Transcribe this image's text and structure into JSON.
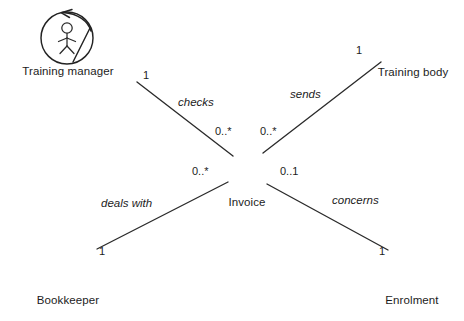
{
  "diagram": {
    "type": "uml-object-model",
    "background_color": "#ffffff",
    "stroke_color": "#232323",
    "nodes": [
      {
        "id": "training-manager",
        "label": "Training manager",
        "symbol": "actor-in-circle",
        "position": "top-left"
      },
      {
        "id": "training-body",
        "label": "Training body",
        "symbol": "stick-figure",
        "position": "top-right"
      },
      {
        "id": "invoice",
        "label": "Invoice",
        "symbol": "entity-circle",
        "position": "center"
      },
      {
        "id": "bookkeeper",
        "label": "Bookkeeper",
        "symbol": "actor-in-circle",
        "position": "bottom-left"
      },
      {
        "id": "enrolment",
        "label": "Enrolment",
        "symbol": "entity-circle",
        "position": "bottom-right"
      }
    ],
    "associations": [
      {
        "id": "checks",
        "label": "checks",
        "from": "training-manager",
        "to": "invoice",
        "from_multiplicity": "1",
        "to_multiplicity": "0..*"
      },
      {
        "id": "sends",
        "label": "sends",
        "from": "training-body",
        "to": "invoice",
        "from_multiplicity": "1",
        "to_multiplicity": "0..*"
      },
      {
        "id": "deals-with",
        "label": "deals with",
        "from": "bookkeeper",
        "to": "invoice",
        "from_multiplicity": "1",
        "to_multiplicity": "0..*"
      },
      {
        "id": "concerns",
        "label": "concerns",
        "from": "invoice",
        "to": "enrolment",
        "from_multiplicity": "0..1",
        "to_multiplicity": "1"
      }
    ],
    "multiplicities": {
      "checks_near_manager": "1",
      "checks_near_invoice": "0..*",
      "sends_near_body": "1",
      "sends_near_invoice": "0..*",
      "deals_with_near_bookkeeper": "1",
      "deals_with_near_invoice": "0..*",
      "concerns_near_invoice": "0..1",
      "concerns_near_enrolment": "1"
    }
  }
}
